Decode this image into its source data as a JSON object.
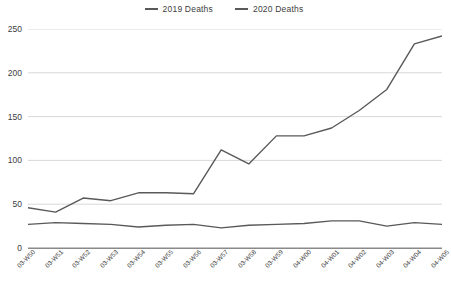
{
  "legend": {
    "position": "top-center",
    "entries": [
      {
        "label": "2019 Deaths",
        "color": "#595959",
        "name": "legend-2019"
      },
      {
        "label": "2020 Deaths",
        "color": "#595959",
        "name": "legend-2020"
      }
    ]
  },
  "axis": {
    "y_ticks": [
      "0",
      "50",
      "100",
      "150",
      "200",
      "250"
    ],
    "y_values": [
      0,
      50,
      100,
      150,
      200,
      250
    ]
  },
  "chart_data": {
    "type": "line",
    "title": "",
    "xlabel": "",
    "ylabel": "",
    "ylim": [
      0,
      250
    ],
    "grid": true,
    "legend_position": "top-center",
    "categories": [
      "03-W50",
      "03-W51",
      "03-W52",
      "03-W53",
      "03-W54",
      "03-W55",
      "03-W56",
      "03-W57",
      "03-W58",
      "03-W59",
      "04-W00",
      "04-W01",
      "04-W02",
      "04-W03",
      "04-W04",
      "04-W05"
    ],
    "series": [
      {
        "name": "2019 Deaths",
        "color": "#595959",
        "values": [
          27,
          29,
          28,
          27,
          24,
          26,
          27,
          23,
          26,
          27,
          28,
          31,
          31,
          25,
          29,
          27
        ]
      },
      {
        "name": "2020 Deaths",
        "color": "#595959",
        "values": [
          46,
          41,
          57,
          54,
          63,
          63,
          62,
          112,
          96,
          128,
          128,
          137,
          157,
          181,
          233,
          242
        ]
      }
    ]
  }
}
